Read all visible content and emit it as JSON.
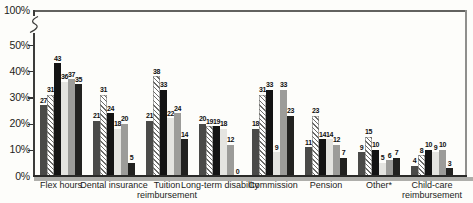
{
  "chart_data": {
    "type": "bar",
    "title": "",
    "unit": "%",
    "categories": [
      "Flex hours",
      "Dental insurance",
      "Tuition reimbursement",
      "Long-term disability",
      "Commission",
      "Pension",
      "Other*",
      "Child-care reimbursement"
    ],
    "series": [
      {
        "name": "dark-gray-solid",
        "fill": "solid",
        "color": "#4a4a48",
        "values": [
          27,
          21,
          21,
          20,
          18,
          11,
          9,
          4
        ]
      },
      {
        "name": "diagonal-hatch",
        "fill": "diagonal-hatch",
        "color": "#ffffff",
        "hatch_color": "#6b6b69",
        "values": [
          31,
          31,
          38,
          19,
          31,
          23,
          15,
          8
        ]
      },
      {
        "name": "black-solid",
        "fill": "solid",
        "color": "#141414",
        "values": [
          43,
          24,
          33,
          19,
          33,
          14,
          10,
          10
        ]
      },
      {
        "name": "light-gray-solid",
        "fill": "solid",
        "color": "#e4e4e0",
        "values": [
          36,
          18,
          22,
          18,
          9,
          14,
          5,
          9
        ]
      },
      {
        "name": "medium-gray-solid",
        "fill": "solid",
        "color": "#9c9c99",
        "values": [
          37,
          20,
          24,
          12,
          33,
          12,
          6,
          10
        ]
      },
      {
        "name": "near-black-solid",
        "fill": "solid",
        "color": "#222220",
        "values": [
          35,
          5,
          14,
          0,
          23,
          7,
          7,
          3
        ]
      }
    ],
    "value_labels_shown": true,
    "y_axis": {
      "ticks": [
        {
          "label": "100%",
          "value": 100
        },
        {
          "label": "50%",
          "value": 50
        },
        {
          "label": "40%",
          "value": 40
        },
        {
          "label": "30%",
          "value": 30
        },
        {
          "label": "20%",
          "value": 20
        },
        {
          "label": "10%",
          "value": 10
        },
        {
          "label": "0%",
          "value": 0
        }
      ],
      "axis_break_between": [
        50,
        100
      ]
    },
    "xlabel": "",
    "ylabel": "",
    "grid": false,
    "legend": "none"
  }
}
